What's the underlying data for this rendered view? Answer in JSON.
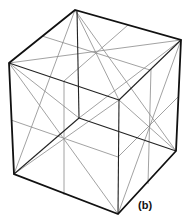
{
  "figure": {
    "label": "(b)",
    "colors": {
      "edge": "#111111",
      "guide": "#8a8a8a",
      "background": "#ffffff"
    },
    "vertices": {
      "top_back": [
        75,
        10
      ],
      "top_right": [
        181,
        40
      ],
      "top_front": [
        119,
        100
      ],
      "top_left": [
        9,
        63
      ],
      "bottom_left": [
        14,
        174
      ],
      "bottom_front": [
        118,
        214
      ],
      "bottom_right": [
        176,
        151
      ],
      "bottom_back_hidden": [
        79,
        118
      ]
    },
    "face_centers": {
      "top": [
        96,
        52
      ],
      "left": [
        64,
        139
      ],
      "right": [
        150,
        127
      ]
    }
  }
}
